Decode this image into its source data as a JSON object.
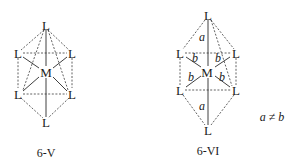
{
  "figures": [
    {
      "id": "6-V",
      "caption": "6-V",
      "center_atom": "M",
      "ligand_label": "L",
      "ligands": [
        "L",
        "L",
        "L",
        "L",
        "L",
        "L"
      ],
      "bond_labels": []
    },
    {
      "id": "6-VI",
      "caption": "6-VI",
      "center_atom": "M",
      "ligand_label": "L",
      "ligands": [
        "L",
        "L",
        "L",
        "L",
        "L",
        "L"
      ],
      "bond_labels": [
        "a",
        "b",
        "b",
        "b",
        "b",
        "a"
      ],
      "condition": "a ≠ b"
    }
  ]
}
